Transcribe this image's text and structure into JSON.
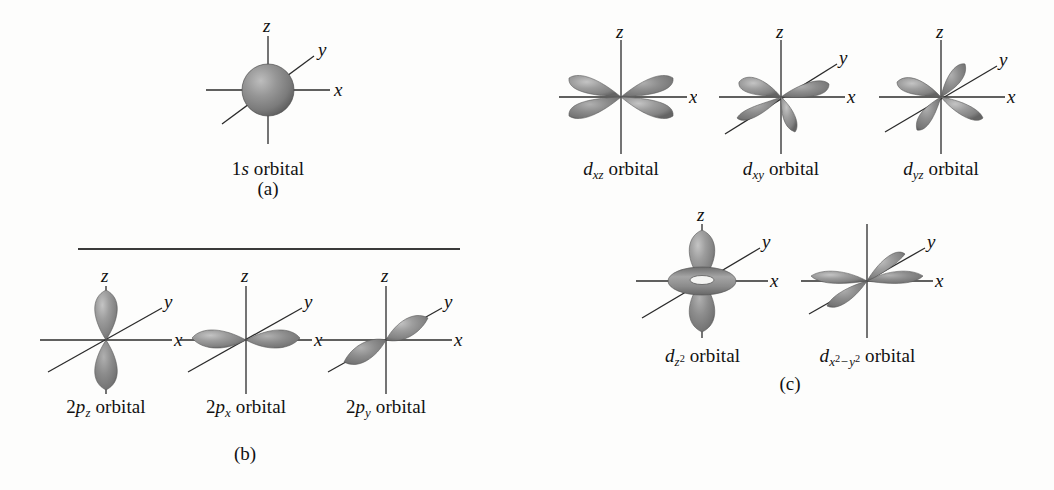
{
  "figure": {
    "background_color": "#fdfdfc",
    "ink_color": "#1a1a1a",
    "orbital_fill": "#8c8c8c",
    "orbital_highlight": "#c9c9c9",
    "orbital_shadow": "#5e5e5e",
    "axis_color": "#2b2b2b"
  },
  "panels": [
    {
      "id": "a",
      "label": "(a)",
      "label_x": 268,
      "label_y": 178
    },
    {
      "id": "b",
      "label": "(b)",
      "label_x": 245,
      "label_y": 443
    },
    {
      "id": "c",
      "label": "(c)",
      "label_x": 790,
      "label_y": 373
    }
  ],
  "divider": {
    "x": 78,
    "y": 248,
    "width": 382,
    "height": 2
  },
  "orbitals": [
    {
      "name": "1s",
      "type": "s",
      "panel": "a",
      "caption_prefix": "1",
      "caption_symbol": "s",
      "caption_sub": "",
      "caption_sub_sup": "",
      "caption_suffix": " orbital",
      "caption_full": "1s orbital",
      "x": 188,
      "y": 16,
      "w": 160,
      "h": 140,
      "caption_y": 142,
      "axes": [
        "z",
        "y",
        "x"
      ]
    },
    {
      "name": "2pz",
      "type": "p",
      "panel": "b",
      "caption_prefix": "2",
      "caption_symbol": "p",
      "caption_sub": "z",
      "caption_sub_sup": "",
      "caption_suffix": " orbital",
      "caption_full": "2pz orbital",
      "x": 26,
      "y": 268,
      "w": 160,
      "h": 140,
      "caption_y": 128,
      "axes": [
        "z",
        "y",
        "x"
      ]
    },
    {
      "name": "2px",
      "type": "p",
      "panel": "b",
      "caption_prefix": "2",
      "caption_symbol": "p",
      "caption_sub": "x",
      "caption_sub_sup": "",
      "caption_suffix": " orbital",
      "caption_full": "2px orbital",
      "x": 166,
      "y": 268,
      "w": 160,
      "h": 140,
      "caption_y": 128,
      "axes": [
        "z",
        "y",
        "x"
      ]
    },
    {
      "name": "2py",
      "type": "p",
      "panel": "b",
      "caption_prefix": "2",
      "caption_symbol": "p",
      "caption_sub": "y",
      "caption_sub_sup": "",
      "caption_suffix": " orbital",
      "caption_full": "2py orbital",
      "x": 306,
      "y": 268,
      "w": 160,
      "h": 140,
      "caption_y": 128,
      "axes": [
        "z",
        "y",
        "x"
      ]
    },
    {
      "name": "dxz",
      "type": "d-clover-xz",
      "panel": "c",
      "caption_prefix": "",
      "caption_symbol": "d",
      "caption_sub": "xz",
      "caption_sub_sup": "",
      "caption_suffix": " orbital",
      "caption_full": "dxz orbital",
      "x": 545,
      "y": 26,
      "w": 152,
      "h": 140,
      "caption_y": 132,
      "axes": [
        "z",
        "x"
      ]
    },
    {
      "name": "dxy",
      "type": "d-clover-xy",
      "panel": "c",
      "caption_prefix": "",
      "caption_symbol": "d",
      "caption_sub": "xy",
      "caption_sub_sup": "",
      "caption_suffix": " orbital",
      "caption_full": "dxy orbital",
      "x": 705,
      "y": 26,
      "w": 152,
      "h": 140,
      "caption_y": 132,
      "axes": [
        "z",
        "y",
        "x"
      ]
    },
    {
      "name": "dyz",
      "type": "d-clover-yz",
      "panel": "c",
      "caption_prefix": "",
      "caption_symbol": "d",
      "caption_sub": "yz",
      "caption_sub_sup": "",
      "caption_suffix": " orbital",
      "caption_full": "dyz orbital",
      "x": 865,
      "y": 26,
      "w": 152,
      "h": 140,
      "caption_y": 132,
      "axes": [
        "z",
        "y",
        "x"
      ]
    },
    {
      "name": "dz2",
      "type": "d-z2",
      "panel": "c",
      "caption_prefix": "",
      "caption_symbol": "d",
      "caption_sub": "z",
      "caption_sub_sup": "2",
      "caption_suffix": " orbital",
      "caption_full": "dz2 orbital",
      "x": 620,
      "y": 208,
      "w": 165,
      "h": 145,
      "caption_y": 137,
      "axes": [
        "z",
        "y",
        "x"
      ]
    },
    {
      "name": "dx2-y2",
      "type": "d-x2y2",
      "panel": "c",
      "caption_prefix": "",
      "caption_symbol": "d",
      "caption_sub": "x",
      "caption_sub_sup": "2",
      "caption_sub_2": "−y",
      "caption_sub_sup_2": "2",
      "caption_suffix": " orbital",
      "caption_full": "dx2−y2 orbital",
      "x": 785,
      "y": 208,
      "w": 165,
      "h": 145,
      "caption_y": 137,
      "axes": [
        "z",
        "y",
        "x"
      ]
    }
  ],
  "axis_labels": {
    "z": "z",
    "y": "y",
    "x": "x"
  }
}
